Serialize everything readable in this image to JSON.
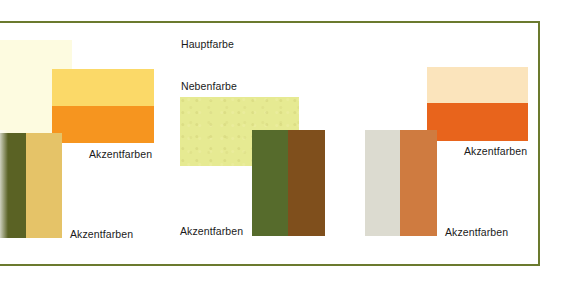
{
  "labels": {
    "main_color": "Hauptfarbe",
    "secondary_color": "Nebenfarbe",
    "accent_left_top": "Akzentfarben",
    "accent_left_bottom": "Akzentfarben",
    "accent_middle": "Akzentfarben",
    "accent_right_top": "Akzentfarben",
    "accent_right_bottom": "Akzentfarben"
  },
  "colors": {
    "frame": "#6b7a2e",
    "left": {
      "cream": "#fdfbe0",
      "yellow": "#fbd968",
      "orange": "#f6951f",
      "olive": "#5a6224",
      "tan": "#e5c368"
    },
    "middle": {
      "pale_yellow_green": "#e6ea92",
      "green": "#566b2c",
      "brown": "#7f4f1c"
    },
    "right": {
      "cream": "#fbe4bc",
      "orange": "#e8641c",
      "gray": "#dcdbd0",
      "copper": "#cf7b40"
    }
  }
}
